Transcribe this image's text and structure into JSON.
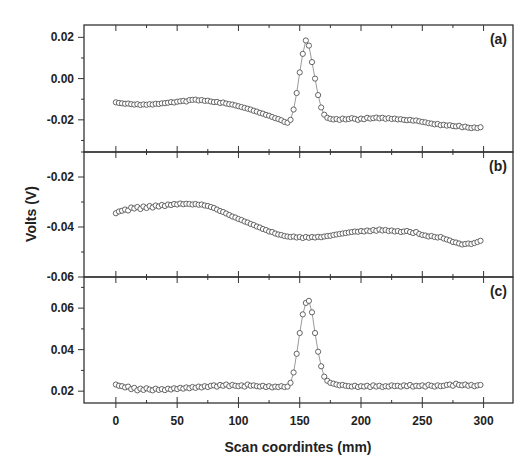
{
  "figure": {
    "xlabel": "Scan coordintes (mm)",
    "ylabel": "Volts (V)",
    "x_ticks": [
      0,
      50,
      100,
      150,
      200,
      250,
      300
    ],
    "x_tick_labels": [
      "0",
      "50",
      "100",
      "150",
      "200",
      "250",
      "300"
    ],
    "colors": {
      "axis": "#333333",
      "marker": "#555555",
      "text": "#222222",
      "background": "#ffffff"
    }
  },
  "chart_data": [
    {
      "type": "line",
      "panel": "(a)",
      "title": "",
      "xlabel": "Scan coordintes (mm)",
      "ylabel": "Volts (V)",
      "xlim": [
        -26,
        324
      ],
      "ylim": [
        -0.0356,
        0.026
      ],
      "y_ticks": [
        0.02,
        0.0,
        -0.02
      ],
      "y_tick_labels": [
        "0.02",
        "0.00",
        "-0.02"
      ],
      "grid": false,
      "marker": "open-circle",
      "series": [
        {
          "name": "(a)",
          "x": [
            0,
            2.5,
            5,
            7.5,
            10,
            12.5,
            15,
            17.5,
            20,
            22.5,
            25,
            27.5,
            30,
            32.5,
            35,
            37.5,
            40,
            42.5,
            45,
            47.5,
            50,
            52.5,
            55,
            57.5,
            60,
            62.5,
            65,
            67.5,
            70,
            72.5,
            75,
            77.5,
            80,
            82.5,
            85,
            87.5,
            90,
            92.5,
            95,
            97.5,
            100,
            102.5,
            105,
            107.5,
            110,
            112.5,
            115,
            117.5,
            120,
            122.5,
            125,
            127.5,
            130,
            132.5,
            135,
            137.5,
            140,
            142.5,
            145,
            147.5,
            150,
            152.5,
            155,
            157.5,
            160,
            162.5,
            165,
            167.5,
            170,
            172.5,
            175,
            177.5,
            180,
            182.5,
            185,
            187.5,
            190,
            192.5,
            195,
            197.5,
            200,
            202.5,
            205,
            207.5,
            210,
            212.5,
            215,
            217.5,
            220,
            222.5,
            225,
            227.5,
            230,
            232.5,
            235,
            237.5,
            240,
            242.5,
            245,
            247.5,
            250,
            252.5,
            255,
            257.5,
            260,
            262.5,
            265,
            267.5,
            270,
            272.5,
            275,
            277.5,
            280,
            282.5,
            285,
            287.5,
            290,
            292.5,
            295,
            297.5
          ],
          "values": [
            -0.0115,
            -0.0118,
            -0.012,
            -0.0122,
            -0.0121,
            -0.0124,
            -0.0126,
            -0.0124,
            -0.0128,
            -0.0125,
            -0.0127,
            -0.0124,
            -0.0126,
            -0.0122,
            -0.0123,
            -0.012,
            -0.0119,
            -0.0117,
            -0.0114,
            -0.0116,
            -0.0112,
            -0.011,
            -0.0108,
            -0.0111,
            -0.0104,
            -0.0103,
            -0.0102,
            -0.0106,
            -0.0104,
            -0.0108,
            -0.0107,
            -0.0111,
            -0.0114,
            -0.0113,
            -0.0118,
            -0.0116,
            -0.0121,
            -0.0124,
            -0.0126,
            -0.013,
            -0.0134,
            -0.0138,
            -0.0142,
            -0.0146,
            -0.015,
            -0.0156,
            -0.016,
            -0.0166,
            -0.017,
            -0.0176,
            -0.018,
            -0.0186,
            -0.0192,
            -0.0196,
            -0.0202,
            -0.021,
            -0.0214,
            -0.02,
            -0.015,
            -0.007,
            0.003,
            0.012,
            0.0185,
            0.016,
            0.008,
            0.0,
            -0.008,
            -0.014,
            -0.0175,
            -0.019,
            -0.0195,
            -0.0198,
            -0.0196,
            -0.02,
            -0.0194,
            -0.0198,
            -0.0196,
            -0.0192,
            -0.0195,
            -0.02,
            -0.0194,
            -0.0197,
            -0.019,
            -0.0194,
            -0.0192,
            -0.0189,
            -0.0193,
            -0.019,
            -0.0195,
            -0.0192,
            -0.0196,
            -0.0194,
            -0.0198,
            -0.0197,
            -0.02,
            -0.0202,
            -0.02,
            -0.0204,
            -0.0203,
            -0.0207,
            -0.021,
            -0.0212,
            -0.0216,
            -0.0218,
            -0.0222,
            -0.022,
            -0.0226,
            -0.0224,
            -0.0228,
            -0.0226,
            -0.023,
            -0.0232,
            -0.0229,
            -0.0236,
            -0.0233,
            -0.0238,
            -0.024,
            -0.0237,
            -0.024,
            -0.0236
          ]
        }
      ]
    },
    {
      "type": "line",
      "panel": "(b)",
      "title": "",
      "xlabel": "Scan coordintes (mm)",
      "ylabel": "Volts (V)",
      "xlim": [
        -26,
        324
      ],
      "ylim": [
        -0.06,
        -0.01
      ],
      "y_ticks": [
        -0.02,
        -0.04,
        -0.06
      ],
      "y_tick_labels": [
        "-0.02",
        "-0.04",
        "-0.06"
      ],
      "grid": false,
      "marker": "open-circle",
      "series": [
        {
          "name": "(b)",
          "x": [
            0,
            2.5,
            5,
            7.5,
            10,
            12.5,
            15,
            17.5,
            20,
            22.5,
            25,
            27.5,
            30,
            32.5,
            35,
            37.5,
            40,
            42.5,
            45,
            47.5,
            50,
            52.5,
            55,
            57.5,
            60,
            62.5,
            65,
            67.5,
            70,
            72.5,
            75,
            77.5,
            80,
            82.5,
            85,
            87.5,
            90,
            92.5,
            95,
            97.5,
            100,
            102.5,
            105,
            107.5,
            110,
            112.5,
            115,
            117.5,
            120,
            122.5,
            125,
            127.5,
            130,
            132.5,
            135,
            137.5,
            140,
            142.5,
            145,
            147.5,
            150,
            152.5,
            155,
            157.5,
            160,
            162.5,
            165,
            167.5,
            170,
            172.5,
            175,
            177.5,
            180,
            182.5,
            185,
            187.5,
            190,
            192.5,
            195,
            197.5,
            200,
            202.5,
            205,
            207.5,
            210,
            212.5,
            215,
            217.5,
            220,
            222.5,
            225,
            227.5,
            230,
            232.5,
            235,
            237.5,
            240,
            242.5,
            245,
            247.5,
            250,
            252.5,
            255,
            257.5,
            260,
            262.5,
            265,
            267.5,
            270,
            272.5,
            275,
            277.5,
            280,
            282.5,
            285,
            287.5,
            290,
            292.5,
            295,
            297.5
          ],
          "values": [
            -0.0345,
            -0.0338,
            -0.0335,
            -0.033,
            -0.0334,
            -0.0322,
            -0.0326,
            -0.032,
            -0.0328,
            -0.0318,
            -0.0324,
            -0.0316,
            -0.0322,
            -0.0314,
            -0.0318,
            -0.0312,
            -0.0316,
            -0.031,
            -0.0312,
            -0.0308,
            -0.031,
            -0.0306,
            -0.0309,
            -0.0307,
            -0.0308,
            -0.031,
            -0.0308,
            -0.0311,
            -0.031,
            -0.0314,
            -0.0316,
            -0.032,
            -0.0324,
            -0.033,
            -0.0336,
            -0.034,
            -0.0346,
            -0.0352,
            -0.0358,
            -0.0362,
            -0.0368,
            -0.0372,
            -0.0378,
            -0.0382,
            -0.0388,
            -0.0392,
            -0.0398,
            -0.0402,
            -0.0408,
            -0.0412,
            -0.0418,
            -0.042,
            -0.0426,
            -0.043,
            -0.0432,
            -0.0436,
            -0.0438,
            -0.044,
            -0.0438,
            -0.0442,
            -0.044,
            -0.0444,
            -0.044,
            -0.0443,
            -0.044,
            -0.0442,
            -0.0439,
            -0.0441,
            -0.0438,
            -0.0436,
            -0.0435,
            -0.0432,
            -0.043,
            -0.0428,
            -0.0426,
            -0.0424,
            -0.0422,
            -0.042,
            -0.0418,
            -0.0419,
            -0.0416,
            -0.0418,
            -0.0414,
            -0.0417,
            -0.0412,
            -0.0415,
            -0.041,
            -0.0414,
            -0.0412,
            -0.0416,
            -0.0414,
            -0.0418,
            -0.0416,
            -0.042,
            -0.0418,
            -0.0416,
            -0.042,
            -0.0424,
            -0.042,
            -0.0428,
            -0.0432,
            -0.0434,
            -0.0438,
            -0.0436,
            -0.044,
            -0.0442,
            -0.044,
            -0.0446,
            -0.045,
            -0.0454,
            -0.046,
            -0.0462,
            -0.0466,
            -0.047,
            -0.0468,
            -0.0466,
            -0.0468,
            -0.0464,
            -0.046,
            -0.0455
          ]
        }
      ]
    },
    {
      "type": "line",
      "panel": "(c)",
      "title": "",
      "xlabel": "Scan coordintes (mm)",
      "ylabel": "Volts (V)",
      "xlim": [
        -26,
        324
      ],
      "ylim": [
        0.0143,
        0.075
      ],
      "y_ticks": [
        0.06,
        0.04,
        0.02
      ],
      "y_tick_labels": [
        "0.06",
        "0.04",
        "0.02"
      ],
      "grid": false,
      "marker": "open-circle",
      "series": [
        {
          "name": "(c)",
          "x": [
            0,
            2.5,
            5,
            7.5,
            10,
            12.5,
            15,
            17.5,
            20,
            22.5,
            25,
            27.5,
            30,
            32.5,
            35,
            37.5,
            40,
            42.5,
            45,
            47.5,
            50,
            52.5,
            55,
            57.5,
            60,
            62.5,
            65,
            67.5,
            70,
            72.5,
            75,
            77.5,
            80,
            82.5,
            85,
            87.5,
            90,
            92.5,
            95,
            97.5,
            100,
            102.5,
            105,
            107.5,
            110,
            112.5,
            115,
            117.5,
            120,
            122.5,
            125,
            127.5,
            130,
            132.5,
            135,
            137.5,
            140,
            142.5,
            145,
            147.5,
            150,
            152.5,
            155,
            157.5,
            160,
            162.5,
            165,
            167.5,
            170,
            172.5,
            175,
            177.5,
            180,
            182.5,
            185,
            187.5,
            190,
            192.5,
            195,
            197.5,
            200,
            202.5,
            205,
            207.5,
            210,
            212.5,
            215,
            217.5,
            220,
            222.5,
            225,
            227.5,
            230,
            232.5,
            235,
            237.5,
            240,
            242.5,
            245,
            247.5,
            250,
            252.5,
            255,
            257.5,
            260,
            262.5,
            265,
            267.5,
            270,
            272.5,
            275,
            277.5,
            280,
            282.5,
            285,
            287.5,
            290,
            292.5,
            295,
            297.5
          ],
          "values": [
            0.0232,
            0.0226,
            0.0224,
            0.0218,
            0.0222,
            0.021,
            0.0216,
            0.0204,
            0.0212,
            0.0206,
            0.0214,
            0.0208,
            0.0204,
            0.0212,
            0.0206,
            0.021,
            0.0205,
            0.0212,
            0.0208,
            0.0214,
            0.021,
            0.0216,
            0.0212,
            0.0218,
            0.0214,
            0.022,
            0.0216,
            0.0222,
            0.0218,
            0.0224,
            0.022,
            0.0226,
            0.0228,
            0.0222,
            0.023,
            0.0226,
            0.0232,
            0.0224,
            0.023,
            0.0226,
            0.0224,
            0.0228,
            0.0222,
            0.0232,
            0.0226,
            0.0228,
            0.0224,
            0.0222,
            0.0226,
            0.022,
            0.0224,
            0.0218,
            0.0222,
            0.022,
            0.0224,
            0.022,
            0.0222,
            0.024,
            0.029,
            0.038,
            0.048,
            0.057,
            0.0625,
            0.0635,
            0.058,
            0.048,
            0.039,
            0.032,
            0.027,
            0.025,
            0.024,
            0.0236,
            0.0232,
            0.0228,
            0.023,
            0.0226,
            0.0224,
            0.0222,
            0.0226,
            0.022,
            0.0224,
            0.0222,
            0.0226,
            0.022,
            0.0228,
            0.0222,
            0.0226,
            0.022,
            0.0224,
            0.0222,
            0.0228,
            0.0224,
            0.0226,
            0.0222,
            0.0228,
            0.0224,
            0.023,
            0.0222,
            0.0226,
            0.0224,
            0.0228,
            0.0222,
            0.023,
            0.0226,
            0.0222,
            0.0228,
            0.0224,
            0.0226,
            0.023,
            0.0232,
            0.0226,
            0.0236,
            0.023,
            0.0228,
            0.0232,
            0.0226,
            0.023,
            0.0224,
            0.0228,
            0.023
          ]
        }
      ]
    }
  ]
}
